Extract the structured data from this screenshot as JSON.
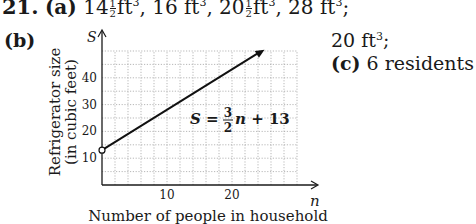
{
  "problem": {
    "number": "21.",
    "part_a": {
      "label": "(a)",
      "answers": [
        {
          "whole": "14",
          "num": "1",
          "den": "2",
          "unit": "ft",
          "exp": "3",
          "sep": ","
        },
        {
          "whole": "16",
          "num": "",
          "den": "",
          "unit": "ft",
          "exp": "3",
          "sep": ","
        },
        {
          "whole": "20",
          "num": "1",
          "den": "2",
          "unit": "ft",
          "exp": "3",
          "sep": ","
        },
        {
          "whole": "28",
          "num": "",
          "den": "",
          "unit": "ft",
          "exp": "3",
          "sep": ";"
        }
      ]
    },
    "part_b": {
      "label": "(b)",
      "answer_value": "20 ft",
      "answer_exp": "3",
      "answer_sep": ";"
    },
    "part_c": {
      "label": "(c)",
      "answer": "6 residents"
    }
  },
  "chart_data": {
    "type": "line",
    "title": "",
    "xlabel": "Number of people in household",
    "ylabel": "Refrigerator size (in cubic feet)",
    "x_axis_var": "n",
    "y_axis_var": "S",
    "xlim": [
      0,
      30
    ],
    "ylim": [
      0,
      50
    ],
    "x_ticks": [
      10,
      20
    ],
    "y_ticks": [
      10,
      20,
      30,
      40
    ],
    "x_grid_step": 2,
    "y_grid_step": 5,
    "grid": true,
    "legend": null,
    "series": [
      {
        "name": "S = 3/2 n + 13",
        "equation": "S = (3/2)n + 13",
        "x": [
          0,
          25
        ],
        "y": [
          13,
          50.5
        ],
        "start_marker": "open-circle",
        "end_marker": "arrow"
      }
    ],
    "annotations": [
      {
        "text": "S = 3/2 n + 13",
        "x": 20,
        "y": 30
      }
    ]
  }
}
